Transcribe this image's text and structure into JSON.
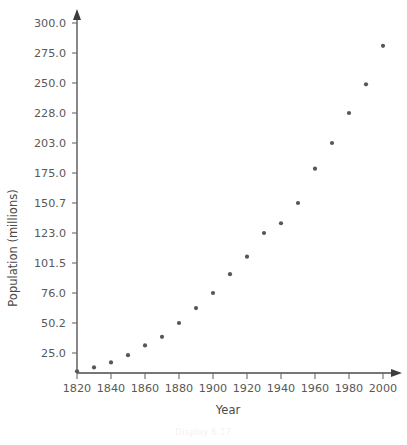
{
  "figure": {
    "caption": "Display 6.17"
  },
  "chart_data": {
    "type": "scatter",
    "title": "",
    "xlabel": "Year",
    "ylabel": "Population (millions)",
    "x": [
      1820,
      1830,
      1840,
      1850,
      1860,
      1870,
      1880,
      1890,
      1900,
      1910,
      1920,
      1930,
      1940,
      1950,
      1960,
      1970,
      1980,
      1990,
      2000
    ],
    "values": [
      9.6,
      12.9,
      17.1,
      23.2,
      31.4,
      38.6,
      50.2,
      63.0,
      76.0,
      92.0,
      106.0,
      123.0,
      132.0,
      150.7,
      179.0,
      203.0,
      228.0,
      249.0,
      281.0
    ],
    "series": [
      {
        "name": "Population",
        "values": [
          9.6,
          12.9,
          17.1,
          23.2,
          31.4,
          38.6,
          50.2,
          63.0,
          76.0,
          92.0,
          106.0,
          123.0,
          132.0,
          150.7,
          179.0,
          203.0,
          228.0,
          249.0,
          281.0
        ]
      }
    ],
    "xticks": [
      1820,
      1840,
      1860,
      1880,
      1900,
      1920,
      1940,
      1960,
      1980,
      2000
    ],
    "xticklabels": [
      "1820",
      "1840",
      "1860",
      "1880",
      "1900",
      "1920",
      "1940",
      "1960",
      "1980",
      "2000"
    ],
    "yticklabels": [
      "25.0",
      "50.2",
      "76.0",
      "101.5",
      "123.0",
      "150.7",
      "175.0",
      "203.0",
      "228.0",
      "250.0",
      "275.0",
      "300.0"
    ],
    "ytickvalues": [
      25.0,
      50.2,
      76.0,
      101.5,
      123.0,
      150.7,
      175.0,
      203.0,
      228.0,
      250.0,
      275.0,
      300.0
    ],
    "xlim": [
      1820,
      2005
    ],
    "ylim": [
      0,
      312
    ],
    "grid": false,
    "legend": null,
    "marker": "circle",
    "marker_color": "#575757"
  }
}
